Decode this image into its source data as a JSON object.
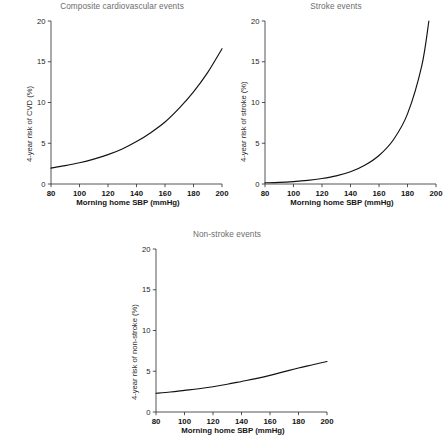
{
  "figure": {
    "background": "#ffffff",
    "axis_color": "#2a2a2a",
    "curve_color": "#111111",
    "title_color": "#6c6c6c"
  },
  "panels": [
    {
      "id": "composite",
      "title": "Composite cardiovascular events",
      "ylabel": "4-year risk of CVD (%)",
      "xlabel": "Morning home SBP (mmHg)"
    },
    {
      "id": "stroke",
      "title": "Stroke events",
      "ylabel": "4-year risk of stroke (%)",
      "xlabel": "Morning home SBP (mmHg)"
    },
    {
      "id": "nonstroke",
      "title": "Non-stroke events",
      "ylabel": "4-year risk of non-stroke (%)",
      "xlabel": "Morning home SBP (mmHg)"
    }
  ],
  "chart_data": [
    {
      "type": "line",
      "title": "Composite cardiovascular events",
      "xlabel": "Morning home SBP (mmHg)",
      "ylabel": "4-year risk of CVD (%)",
      "xlim": [
        80,
        200
      ],
      "ylim": [
        0,
        20
      ],
      "xticks": [
        80,
        100,
        120,
        140,
        160,
        180,
        200
      ],
      "yticks": [
        0,
        5,
        10,
        15,
        20
      ],
      "grid": false,
      "legend": "none",
      "series": [
        {
          "name": "4-year risk of CVD",
          "x": [
            80,
            90,
            100,
            110,
            120,
            130,
            140,
            150,
            160,
            170,
            180,
            190,
            200
          ],
          "y": [
            1.95,
            2.25,
            2.6,
            3.05,
            3.6,
            4.3,
            5.2,
            6.3,
            7.6,
            9.3,
            11.3,
            13.7,
            16.6
          ]
        }
      ]
    },
    {
      "type": "line",
      "title": "Stroke events",
      "xlabel": "Morning home SBP (mmHg)",
      "ylabel": "4-year risk of stroke (%)",
      "xlim": [
        80,
        200
      ],
      "ylim": [
        0,
        20
      ],
      "xticks": [
        80,
        100,
        120,
        140,
        160,
        180,
        200
      ],
      "yticks": [
        0,
        5,
        10,
        15,
        20
      ],
      "grid": false,
      "legend": "none",
      "series": [
        {
          "name": "4-year risk of stroke",
          "x": [
            80,
            90,
            100,
            110,
            120,
            130,
            140,
            150,
            160,
            170,
            180,
            190,
            195
          ],
          "y": [
            0.15,
            0.2,
            0.3,
            0.45,
            0.68,
            1.0,
            1.5,
            2.3,
            3.5,
            5.4,
            8.6,
            14.5,
            20.0
          ]
        }
      ]
    },
    {
      "type": "line",
      "title": "Non-stroke events",
      "xlabel": "Morning home SBP (mmHg)",
      "ylabel": "4-year risk of non-stroke (%)",
      "xlim": [
        80,
        200
      ],
      "ylim": [
        0,
        20
      ],
      "xticks": [
        80,
        100,
        120,
        140,
        160,
        180,
        200
      ],
      "yticks": [
        0,
        5,
        10,
        15,
        20
      ],
      "grid": false,
      "legend": "none",
      "series": [
        {
          "name": "4-year risk of non-stroke",
          "x": [
            80,
            90,
            100,
            110,
            120,
            130,
            140,
            150,
            160,
            170,
            180,
            190,
            200
          ],
          "y": [
            2.3,
            2.45,
            2.65,
            2.85,
            3.1,
            3.4,
            3.75,
            4.1,
            4.5,
            4.95,
            5.4,
            5.8,
            6.2
          ]
        }
      ]
    }
  ]
}
